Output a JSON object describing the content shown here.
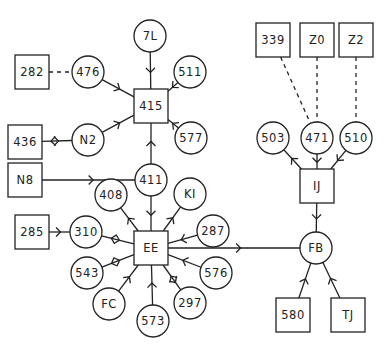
{
  "diagram": {
    "type": "directed-network",
    "nodes": [
      {
        "id": "7L",
        "label": "7L",
        "shape": "circle",
        "x": 150,
        "y": 36
      },
      {
        "id": "282",
        "label": "282",
        "shape": "square",
        "x": 32,
        "y": 72
      },
      {
        "id": "476",
        "label": "476",
        "shape": "circle",
        "x": 88,
        "y": 72
      },
      {
        "id": "511",
        "label": "511",
        "shape": "circle",
        "x": 190,
        "y": 72
      },
      {
        "id": "415",
        "label": "415",
        "shape": "square",
        "x": 151,
        "y": 106
      },
      {
        "id": "436",
        "label": "436",
        "shape": "square",
        "x": 25,
        "y": 142
      },
      {
        "id": "N2",
        "label": "N2",
        "shape": "circle",
        "x": 88,
        "y": 140
      },
      {
        "id": "577",
        "label": "577",
        "shape": "circle",
        "x": 191,
        "y": 138
      },
      {
        "id": "N8",
        "label": "N8",
        "shape": "square",
        "x": 25,
        "y": 180
      },
      {
        "id": "411",
        "label": "411",
        "shape": "circle",
        "x": 151,
        "y": 180
      },
      {
        "id": "408",
        "label": "408",
        "shape": "circle",
        "x": 111,
        "y": 195
      },
      {
        "id": "K1",
        "label": "KI",
        "shape": "circle",
        "x": 190,
        "y": 194
      },
      {
        "id": "285",
        "label": "285",
        "shape": "square",
        "x": 32,
        "y": 232
      },
      {
        "id": "310",
        "label": "310",
        "shape": "circle",
        "x": 86,
        "y": 232
      },
      {
        "id": "287",
        "label": "287",
        "shape": "circle",
        "x": 213,
        "y": 231
      },
      {
        "id": "EE",
        "label": "EE",
        "shape": "square",
        "x": 151,
        "y": 248
      },
      {
        "id": "543",
        "label": "543",
        "shape": "circle",
        "x": 87,
        "y": 273
      },
      {
        "id": "576",
        "label": "576",
        "shape": "circle",
        "x": 216,
        "y": 273
      },
      {
        "id": "FC",
        "label": "FC",
        "shape": "circle",
        "x": 109,
        "y": 304
      },
      {
        "id": "297",
        "label": "297",
        "shape": "circle",
        "x": 190,
        "y": 303
      },
      {
        "id": "573",
        "label": "573",
        "shape": "circle",
        "x": 153,
        "y": 321
      },
      {
        "id": "339",
        "label": "339",
        "shape": "square",
        "x": 273,
        "y": 40
      },
      {
        "id": "Z0",
        "label": "Z0",
        "shape": "square",
        "x": 317,
        "y": 40
      },
      {
        "id": "Z2",
        "label": "Z2",
        "shape": "square",
        "x": 356,
        "y": 40
      },
      {
        "id": "503",
        "label": "503",
        "shape": "circle",
        "x": 273,
        "y": 138
      },
      {
        "id": "471",
        "label": "471",
        "shape": "circle",
        "x": 317,
        "y": 138
      },
      {
        "id": "510",
        "label": "510",
        "shape": "circle",
        "x": 356,
        "y": 138
      },
      {
        "id": "IJ",
        "label": "IJ",
        "shape": "square",
        "x": 317,
        "y": 186
      },
      {
        "id": "FB",
        "label": "FB",
        "shape": "circle",
        "x": 316,
        "y": 248
      },
      {
        "id": "580",
        "label": "580",
        "shape": "square",
        "x": 293,
        "y": 315
      },
      {
        "id": "TJ",
        "label": "TJ",
        "shape": "square",
        "x": 348,
        "y": 315
      }
    ],
    "edges": [
      {
        "from": "7L",
        "to": "415",
        "style": "solid",
        "arrow": "forward"
      },
      {
        "from": "282",
        "to": "476",
        "style": "dashed",
        "arrow": "none"
      },
      {
        "from": "476",
        "to": "415",
        "style": "solid",
        "arrow": "forward"
      },
      {
        "from": "511",
        "to": "415",
        "style": "solid",
        "arrow": "forward"
      },
      {
        "from": "577",
        "to": "415",
        "style": "solid",
        "arrow": "forward"
      },
      {
        "from": "436",
        "to": "N2",
        "style": "solid",
        "arrow": "both"
      },
      {
        "from": "N2",
        "to": "415",
        "style": "solid",
        "arrow": "forward"
      },
      {
        "from": "411",
        "to": "415",
        "style": "solid",
        "arrow": "forward"
      },
      {
        "from": "N8",
        "to": "411",
        "style": "solid",
        "arrow": "forward"
      },
      {
        "from": "411",
        "to": "EE",
        "style": "solid",
        "arrow": "forward"
      },
      {
        "from": "EE",
        "to": "408",
        "style": "solid",
        "arrow": "forward"
      },
      {
        "from": "EE",
        "to": "K1",
        "style": "solid",
        "arrow": "forward"
      },
      {
        "from": "285",
        "to": "310",
        "style": "solid",
        "arrow": "forward"
      },
      {
        "from": "310",
        "to": "EE",
        "style": "solid",
        "arrow": "both"
      },
      {
        "from": "287",
        "to": "EE",
        "style": "solid",
        "arrow": "forward"
      },
      {
        "from": "543",
        "to": "EE",
        "style": "solid",
        "arrow": "both"
      },
      {
        "from": "576",
        "to": "EE",
        "style": "solid",
        "arrow": "forward"
      },
      {
        "from": "FC",
        "to": "EE",
        "style": "solid",
        "arrow": "forward"
      },
      {
        "from": "573",
        "to": "EE",
        "style": "solid",
        "arrow": "forward"
      },
      {
        "from": "297",
        "to": "EE",
        "style": "solid",
        "arrow": "both"
      },
      {
        "from": "EE",
        "to": "FB",
        "style": "solid",
        "arrow": "forward"
      },
      {
        "from": "339",
        "to": "471",
        "style": "dashed",
        "arrow": "none"
      },
      {
        "from": "Z0",
        "to": "471",
        "style": "dashed",
        "arrow": "none"
      },
      {
        "from": "Z2",
        "to": "510",
        "style": "dashed",
        "arrow": "none"
      },
      {
        "from": "IJ",
        "to": "503",
        "style": "solid",
        "arrow": "forward"
      },
      {
        "from": "471",
        "to": "IJ",
        "style": "solid",
        "arrow": "forward"
      },
      {
        "from": "510",
        "to": "IJ",
        "style": "solid",
        "arrow": "forward"
      },
      {
        "from": "IJ",
        "to": "FB",
        "style": "solid",
        "arrow": "forward"
      },
      {
        "from": "580",
        "to": "FB",
        "style": "solid",
        "arrow": "forward"
      },
      {
        "from": "TJ",
        "to": "FB",
        "style": "solid",
        "arrow": "forward"
      }
    ]
  }
}
